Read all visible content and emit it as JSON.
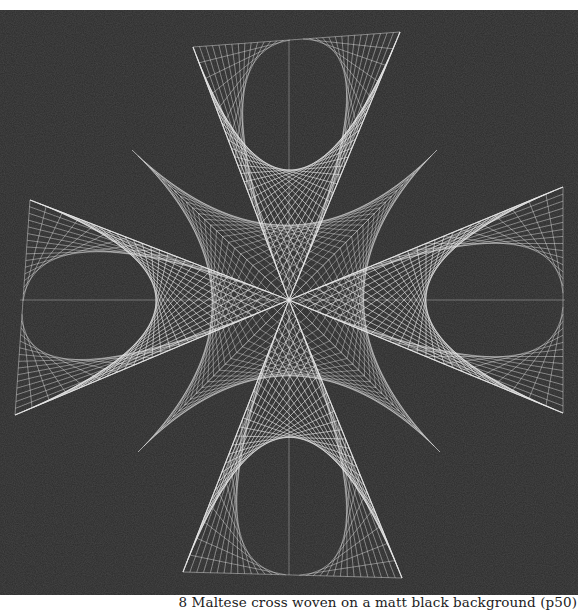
{
  "figure": {
    "caption": "8 Maltese cross woven on a matt black background (p50)",
    "background_color": "#2b2b2b",
    "thread_color": "#e8e8e8",
    "center": [
      289,
      300
    ],
    "outer_arms": [
      {
        "name": "top",
        "tip_a": [
          193,
          47
        ],
        "tip_b": [
          400,
          32
        ]
      },
      {
        "name": "right",
        "tip_a": [
          563,
          187
        ],
        "tip_b": [
          563,
          413
        ]
      },
      {
        "name": "bottom",
        "tip_a": [
          402,
          578
        ],
        "tip_b": [
          183,
          572
        ]
      },
      {
        "name": "left",
        "tip_a": [
          15,
          415
        ],
        "tip_b": [
          30,
          200
        ]
      }
    ],
    "inner_arms": [
      {
        "name": "top-left",
        "tip": [
          132,
          150
        ]
      },
      {
        "name": "top-right",
        "tip": [
          437,
          150
        ]
      },
      {
        "name": "bottom-right",
        "tip": [
          440,
          452
        ]
      },
      {
        "name": "bottom-left",
        "tip": [
          138,
          452
        ]
      }
    ]
  }
}
